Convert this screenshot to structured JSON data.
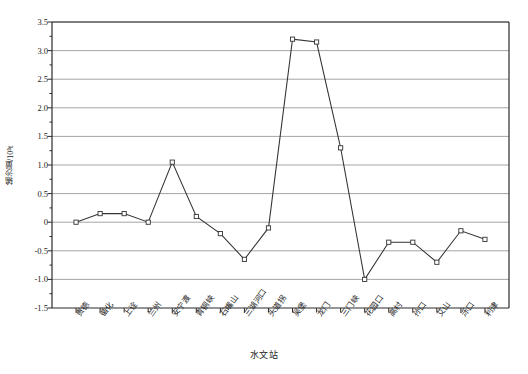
{
  "figure": {
    "xlabel": "水文站",
    "ylabel_text": "输沙量/10",
    "ylabel_exponent": "8",
    "ylabel_unit": "t",
    "ylabel_full": "输沙量/10⁸t"
  },
  "axis": {
    "y_ticks": [
      "3.5",
      "3.0",
      "2.5",
      "2.0",
      "1.5",
      "1.0",
      "0.5",
      "0",
      "-0.5",
      "-1.0",
      "-1.5"
    ],
    "y_tick_values": [
      3.5,
      3.0,
      2.5,
      2.0,
      1.5,
      1.0,
      0.5,
      0,
      -0.5,
      -1.0,
      -1.5
    ],
    "y_min": -1.5,
    "y_max": 3.5,
    "y_major_step": 0.5,
    "y_minor_step": 0.25,
    "grid": "horizontal"
  },
  "style": {
    "line_color": "#333333",
    "marker_color": "#333333",
    "marker_face": "#ffffff",
    "grid_color": "#9a9a9a",
    "frame_color": "#2b2b2b",
    "background": "#ffffff"
  },
  "chart_data": {
    "type": "line",
    "title": "",
    "subtitle": "",
    "xlabel": "水文站",
    "ylabel": "输沙量/10⁸t",
    "ylim": [
      -1.5,
      3.5
    ],
    "grid": true,
    "legend": "none",
    "categories": [
      "贵德",
      "循化",
      "上诠",
      "兰州",
      "安宁渡",
      "青铜峡",
      "石嘴山",
      "三湖河口",
      "头道拐",
      "吴堡",
      "龙门",
      "三门峡",
      "花园口",
      "高村",
      "孙口",
      "艾山",
      "泺口",
      "利津"
    ],
    "series": [
      {
        "name": "输沙量",
        "marker": "open-square",
        "values": [
          0.0,
          0.15,
          0.15,
          0.0,
          1.05,
          0.1,
          -0.2,
          -0.65,
          -0.1,
          3.2,
          3.15,
          1.3,
          -1.0,
          -0.35,
          -0.35,
          -0.7,
          -0.15,
          -0.3
        ]
      }
    ]
  }
}
